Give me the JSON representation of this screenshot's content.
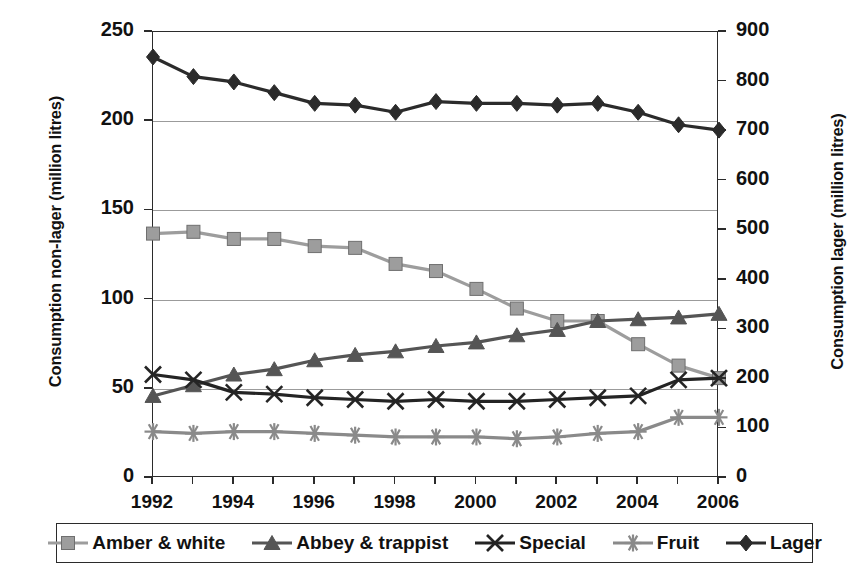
{
  "chart_data": {
    "type": "line",
    "title": "",
    "xlabel": "",
    "ylabel": "Consumption non-lager (million litres)",
    "y2label": "Consumption lager (million litres)",
    "x": [
      1992,
      1993,
      1994,
      1995,
      1996,
      1997,
      1998,
      1999,
      2000,
      2001,
      2002,
      2003,
      2004,
      2005,
      2006
    ],
    "categories": [
      "1992",
      "1993",
      "1994",
      "1995",
      "1996",
      "1997",
      "1998",
      "1999",
      "2000",
      "2001",
      "2002",
      "2003",
      "2004",
      "2005",
      "2006"
    ],
    "xlim": [
      1992,
      2006
    ],
    "ylim": [
      0,
      250
    ],
    "y2lim": [
      0,
      900
    ],
    "yticks": [
      0,
      50,
      100,
      150,
      200,
      250
    ],
    "y2ticks": [
      0,
      100,
      200,
      300,
      400,
      500,
      600,
      700,
      800,
      900
    ],
    "xticks_labeled": [
      "1992",
      "1994",
      "1996",
      "1998",
      "2000",
      "2002",
      "2004",
      "2006"
    ],
    "grid": true,
    "grid_axis": "y",
    "legend_position": "bottom",
    "series": [
      {
        "name": "Amber & white",
        "axis": "left",
        "marker": "square",
        "color": "#9d9d9d",
        "values": [
          137,
          138,
          134,
          134,
          130,
          129,
          120,
          116,
          106,
          95,
          88,
          88,
          75,
          63,
          56
        ]
      },
      {
        "name": "Abbey & trappist",
        "axis": "left",
        "marker": "triangle",
        "color": "#555555",
        "values": [
          46,
          52,
          58,
          61,
          66,
          69,
          71,
          74,
          76,
          80,
          83,
          88,
          89,
          90,
          92
        ]
      },
      {
        "name": "Special",
        "axis": "left",
        "marker": "cross",
        "color": "#242424",
        "values": [
          58,
          55,
          48,
          47,
          45,
          44,
          43,
          44,
          43,
          43,
          44,
          45,
          46,
          55,
          56
        ]
      },
      {
        "name": "Fruit",
        "axis": "left",
        "marker": "asterisk",
        "color": "#8a8a8a",
        "values": [
          26,
          25,
          26,
          26,
          25,
          24,
          23,
          23,
          23,
          22,
          23,
          25,
          26,
          34,
          34
        ]
      },
      {
        "name": "Lager",
        "axis": "right",
        "marker": "diamond",
        "color": "#2b2b2b",
        "values": [
          851,
          810,
          800,
          779,
          757,
          754,
          740,
          759,
          757,
          757,
          752,
          755,
          739,
          712,
          700
        ],
        "values_left_scale": [
          236,
          225,
          222,
          216,
          210,
          209,
          205,
          211,
          210,
          210,
          209,
          210,
          205,
          198,
          195
        ]
      }
    ]
  },
  "legend": {
    "items": [
      {
        "label": "Amber & white",
        "marker": "square",
        "color": "#9d9d9d"
      },
      {
        "label": "Abbey & trappist",
        "marker": "triangle",
        "color": "#555555"
      },
      {
        "label": "Special",
        "marker": "cross",
        "color": "#242424"
      },
      {
        "label": "Fruit",
        "marker": "asterisk",
        "color": "#8a8a8a"
      },
      {
        "label": "Lager",
        "marker": "diamond",
        "color": "#2b2b2b"
      }
    ]
  }
}
